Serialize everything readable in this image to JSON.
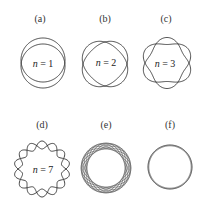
{
  "figure": {
    "panels": [
      {
        "id": "a",
        "label": "(a)",
        "n_label": "n = 1",
        "n_var": "n",
        "n_value": "= 1",
        "center": [
          43,
          63
        ],
        "radius": 22,
        "mode": 1,
        "amp": 3,
        "curves": 2
      },
      {
        "id": "b",
        "label": "(b)",
        "n_label": "n = 2",
        "n_var": "n",
        "n_value": "= 2",
        "center": [
          105,
          64
        ],
        "radius": 22,
        "mode": 2,
        "amp": 3,
        "curves": 2
      },
      {
        "id": "c",
        "label": "(c)",
        "n_label": "n = 3",
        "n_var": "n",
        "n_value": "= 3",
        "center": [
          167,
          63
        ],
        "radius": 22,
        "mode": 3,
        "amp": 3.5,
        "curves": 2
      },
      {
        "id": "d",
        "label": "(d)",
        "n_label": "n = 7",
        "n_var": "n",
        "n_value": "= 7",
        "center": [
          42,
          169
        ],
        "radius": 24,
        "mode": 7,
        "amp": 4,
        "curves": 2
      },
      {
        "id": "e",
        "label": "(e)",
        "n_label": "",
        "center": [
          106,
          168
        ],
        "radius": 22,
        "mode": 3,
        "amp": 3,
        "curves": 8
      },
      {
        "id": "f",
        "label": "(f)",
        "n_label": "",
        "center": [
          170,
          167
        ],
        "radius": 22,
        "mode": 0,
        "amp": 0,
        "curves": 2
      }
    ]
  }
}
